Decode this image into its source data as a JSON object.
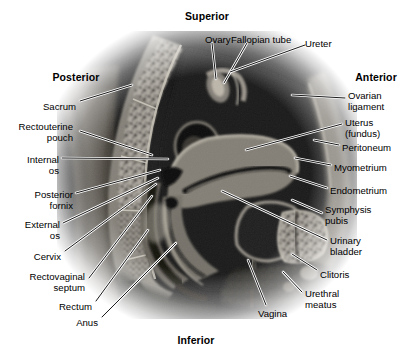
{
  "figure": {
    "type": "labeled-anatomical-photograph",
    "modality": "grayscale sectional anatomy / MRI"
  },
  "orientation": [
    {
      "name": "superior",
      "label": "Superior",
      "x": 207,
      "y": 10
    },
    {
      "name": "inferior",
      "label": "Inferior",
      "x": 196,
      "y": 334
    },
    {
      "name": "posterior",
      "label": "Posterior",
      "x": 76,
      "y": 71
    },
    {
      "name": "anterior",
      "label": "Anterior",
      "x": 376,
      "y": 71
    }
  ],
  "labels": {
    "top": [
      {
        "name": "ovary",
        "label": "Ovary",
        "tx": 205,
        "ty": 35,
        "align": "left",
        "line": [
          [
            212,
            43
          ],
          [
            216,
            79
          ]
        ]
      },
      {
        "name": "fallopian-tube",
        "label": "Fallopian tube",
        "tx": 231,
        "ty": 35,
        "align": "left",
        "line": [
          [
            247,
            43
          ],
          [
            224,
            83
          ]
        ]
      },
      {
        "name": "ureter",
        "label": "Ureter",
        "tx": 305,
        "ty": 39,
        "align": "left",
        "line": [
          [
            305,
            45
          ],
          [
            230,
            72
          ]
        ]
      }
    ],
    "left": [
      {
        "name": "sacrum",
        "label": "Sacrum",
        "tx": 76,
        "ty": 102,
        "align": "right",
        "line": [
          [
            80,
            101
          ],
          [
            132,
            85
          ]
        ]
      },
      {
        "name": "rectouterine-pouch",
        "label": "Rectouterine\npouch",
        "tx": 73,
        "ty": 122,
        "align": "right",
        "line": [
          [
            80,
            131
          ],
          [
            152,
            155
          ]
        ]
      },
      {
        "name": "internal-os",
        "label": "Internal\nos",
        "tx": 59,
        "ty": 155,
        "align": "right",
        "line": [
          [
            62,
            158
          ],
          [
            168,
            159
          ]
        ]
      },
      {
        "name": "posterior-fornix",
        "label": "Posterior\nfornix",
        "tx": 73,
        "ty": 190,
        "align": "right",
        "line": [
          [
            76,
            193
          ],
          [
            160,
            170
          ]
        ]
      },
      {
        "name": "external-os",
        "label": "External\nos",
        "tx": 60,
        "ty": 220,
        "align": "right",
        "line": [
          [
            63,
            223
          ],
          [
            158,
            178
          ]
        ]
      },
      {
        "name": "cervix",
        "label": "Cervix",
        "tx": 61,
        "ty": 252,
        "align": "right",
        "line": [
          [
            65,
            251
          ],
          [
            156,
            184
          ]
        ]
      },
      {
        "name": "rectovaginal-septum",
        "label": "Rectovaginal\nseptum",
        "tx": 85,
        "ty": 272,
        "align": "right",
        "line": [
          [
            89,
            278
          ],
          [
            152,
            196
          ]
        ]
      },
      {
        "name": "rectum",
        "label": "Rectum",
        "tx": 92,
        "ty": 302,
        "align": "right",
        "line": [
          [
            96,
            301
          ],
          [
            148,
            230
          ]
        ]
      },
      {
        "name": "anus",
        "label": "Anus",
        "tx": 98,
        "ty": 318,
        "align": "right",
        "line": [
          [
            102,
            317
          ],
          [
            176,
            243
          ]
        ]
      }
    ],
    "right": [
      {
        "name": "ovarian-ligament",
        "label": "Ovarian\nligament",
        "tx": 348,
        "ty": 91,
        "align": "left",
        "line": [
          [
            345,
            98
          ],
          [
            292,
            95
          ]
        ]
      },
      {
        "name": "uterus-fundus",
        "label": "Uterus\n(fundus)",
        "tx": 345,
        "ty": 118,
        "align": "left",
        "line": [
          [
            342,
            124
          ],
          [
            246,
            150
          ]
        ]
      },
      {
        "name": "peritoneum",
        "label": "Peritoneum",
        "tx": 342,
        "ty": 143,
        "align": "left",
        "line": [
          [
            339,
            145
          ],
          [
            314,
            140
          ]
        ]
      },
      {
        "name": "myometrium",
        "label": "Myometrium",
        "tx": 334,
        "ty": 163,
        "align": "left",
        "line": [
          [
            331,
            165
          ],
          [
            295,
            158
          ]
        ]
      },
      {
        "name": "endometrium",
        "label": "Endometrium",
        "tx": 330,
        "ty": 186,
        "align": "left",
        "line": [
          [
            327,
            188
          ],
          [
            290,
            176
          ]
        ]
      },
      {
        "name": "symphysis-pubis",
        "label": "Symphysis\npubis",
        "tx": 325,
        "ty": 205,
        "align": "left",
        "line": [
          [
            322,
            213
          ],
          [
            292,
            200
          ]
        ]
      },
      {
        "name": "urinary-bladder",
        "label": "Urinary\nbladder",
        "tx": 330,
        "ty": 236,
        "align": "left",
        "line": [
          [
            327,
            240
          ],
          [
            222,
            191
          ]
        ]
      },
      {
        "name": "clitoris",
        "label": "Clitoris",
        "tx": 320,
        "ty": 270,
        "align": "left",
        "line": [
          [
            317,
            270
          ],
          [
            292,
            254
          ]
        ]
      },
      {
        "name": "urethral-meatus",
        "label": "Urethral\nmeatus",
        "tx": 305,
        "ty": 289,
        "align": "left",
        "line": [
          [
            302,
            292
          ],
          [
            283,
            272
          ]
        ]
      }
    ],
    "bottom": [
      {
        "name": "vagina",
        "label": "Vagina",
        "tx": 258,
        "ty": 309,
        "align": "left",
        "line": [
          [
            266,
            305
          ],
          [
            248,
            260
          ]
        ]
      }
    ]
  },
  "colors": {
    "background": "#ffffff",
    "text": "#000000",
    "leader_dark": "#000000",
    "leader_light": "#ffffff"
  }
}
